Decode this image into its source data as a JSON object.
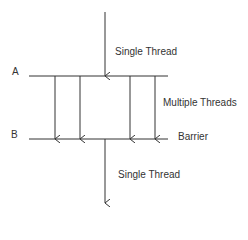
{
  "diagram": {
    "title": "",
    "labels": {
      "point_a": "A",
      "point_b": "B",
      "top_thread": "Single Thread",
      "middle_threads": "Multiple Threads",
      "barrier": "Barrier",
      "bottom_thread": "Single Thread"
    },
    "nodes": [
      {
        "id": "A",
        "label": "A",
        "type": "fork-line"
      },
      {
        "id": "B",
        "label": "B",
        "type": "barrier-line"
      }
    ],
    "edges": [
      {
        "from": "start",
        "to": "A",
        "label": "Single Thread"
      },
      {
        "from": "A",
        "to": "B",
        "label": "Multiple Threads",
        "count": 4
      },
      {
        "from": "B",
        "to": "end",
        "label": "Single Thread"
      }
    ],
    "colors": {
      "line": "#333333",
      "background": "#ffffff"
    }
  }
}
